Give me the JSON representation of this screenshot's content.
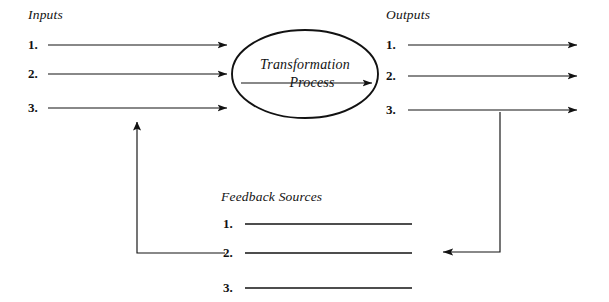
{
  "diagram": {
    "type": "systems-flow",
    "background_color": "#ffffff",
    "stroke_color": "#121212",
    "inputs": {
      "title": "Inputs",
      "items": [
        "1.",
        "2.",
        "3."
      ]
    },
    "process": {
      "shape": "ellipse",
      "line1": "Transformation",
      "line2": "Process"
    },
    "outputs": {
      "title": "Outputs",
      "items": [
        "1.",
        "2.",
        "3."
      ]
    },
    "feedback": {
      "title": "Feedback Sources",
      "items": [
        "1.",
        "2.",
        "3."
      ]
    },
    "connectors": {
      "input_arrows": 3,
      "output_arrows": 3,
      "left_feedback_loop": "up-arrow-to-inputs",
      "right_feedback_loop": "left-arrow-to-feedback"
    }
  }
}
